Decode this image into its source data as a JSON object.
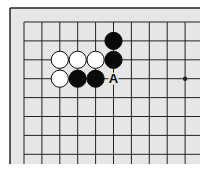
{
  "diagram": {
    "type": "go-board-fragment",
    "colors": {
      "board": "#e6e6e6",
      "line": "#222222",
      "black": "#0a0a0a",
      "white": "#ffffff"
    },
    "grid": {
      "cols": 10,
      "rows": 8,
      "x0": 24,
      "y0": 22,
      "dx": 17.9,
      "dy": 18.9
    },
    "star_points": [
      {
        "col": 9,
        "row": 3
      }
    ],
    "stones": [
      {
        "color": "black",
        "col": 5,
        "row": 1
      },
      {
        "color": "black",
        "col": 5,
        "row": 2
      },
      {
        "color": "black",
        "col": 3,
        "row": 3
      },
      {
        "color": "black",
        "col": 4,
        "row": 3
      },
      {
        "color": "white",
        "col": 2,
        "row": 2
      },
      {
        "color": "white",
        "col": 3,
        "row": 2
      },
      {
        "color": "white",
        "col": 4,
        "row": 2
      },
      {
        "color": "white",
        "col": 2,
        "row": 3
      }
    ],
    "labels": [
      {
        "text": "A",
        "col": 5,
        "row": 3
      }
    ]
  }
}
